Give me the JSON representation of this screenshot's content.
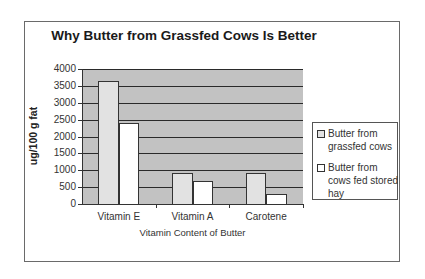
{
  "chart_data": {
    "type": "bar",
    "title": "Why Butter from Grassfed Cows Is Better",
    "xlabel": "Vitamin Content of Butter",
    "ylabel": "ug/100 g fat",
    "categories": [
      "Vitamin E",
      "Vitamin A",
      "Carotene"
    ],
    "series": [
      {
        "name": "Butter from grassfed cows",
        "color": "#e2e2e2",
        "values": [
          3630,
          920,
          920
        ]
      },
      {
        "name": "Butter from cows fed stored hay",
        "color": "#ffffff",
        "values": [
          2400,
          670,
          300
        ]
      }
    ],
    "ylim": [
      0,
      4000
    ],
    "yticks": [
      "4000",
      "3500",
      "3000",
      "2500",
      "2000",
      "1500",
      "1000",
      "500",
      "0"
    ],
    "grid": true,
    "legend_position": "right",
    "plot_background": "#c2c2c2"
  }
}
